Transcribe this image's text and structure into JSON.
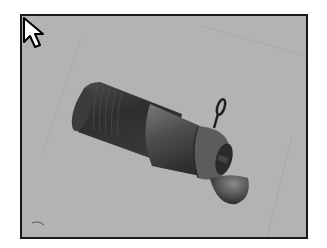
{
  "viewport": {
    "background_color": "#b3b3b3",
    "border_color": "#1a1a1a",
    "model": {
      "name": "nozzle-assembly",
      "parts": [
        "threaded-body",
        "tapered-nozzle",
        "tip-collar",
        "hanging-ring",
        "hinged-cap"
      ]
    },
    "cursor": "arrow-pointer"
  }
}
